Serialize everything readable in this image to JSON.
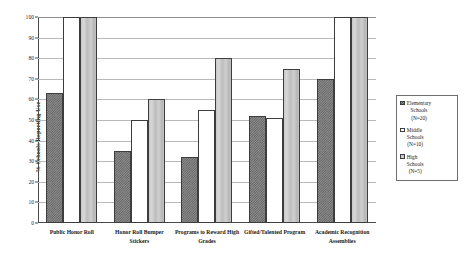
{
  "chart_data": {
    "type": "bar",
    "title": "",
    "xlabel": "",
    "ylabel": "% Schools Reporting Use",
    "ylim": [
      0,
      100
    ],
    "ytick_step": 10,
    "yticks": [
      0,
      10,
      20,
      30,
      40,
      50,
      60,
      70,
      80,
      90,
      100
    ],
    "grid": true,
    "legend_position": "right",
    "categories": [
      "Public Honor Roll",
      "Honor Roll Bumper Stickers",
      "Programs to Reward High Grades",
      "Gifted/Talented Program",
      "Academic Recognition Assemblies"
    ],
    "series": [
      {
        "name": "Elementary Schools (N=20)",
        "key": "elementary",
        "values": [
          63,
          35,
          32,
          52,
          70
        ]
      },
      {
        "name": "Middle Schools (N=10)",
        "key": "middle",
        "values": [
          100,
          50,
          55,
          51,
          100
        ]
      },
      {
        "name": "High Schools (N=5)",
        "key": "high",
        "values": [
          100,
          60,
          80,
          75,
          100
        ]
      }
    ]
  },
  "legend": {
    "entries": [
      {
        "line1": "Elementary",
        "line2": "Schools",
        "line3": "(N=20)"
      },
      {
        "line1": "Middle",
        "line2": "Schools",
        "line3": "(N=10)"
      },
      {
        "line1": "High",
        "line2": "Schools",
        "line3": "(N=5)"
      }
    ]
  },
  "xlabels": [
    {
      "line1": "Public Honor Roll",
      "line2": ""
    },
    {
      "line1": "Honor Roll Bumper",
      "line2": "Stickers"
    },
    {
      "line1": "Programs to Reward High",
      "line2": "Grades"
    },
    {
      "line1": "Gifted/Talented Program",
      "line2": ""
    },
    {
      "line1": "Academic Recognition",
      "line2": "Assemblies"
    }
  ],
  "colors": {
    "elementary": "#8d8d8d",
    "middle": "#ffffff",
    "high": "#c6c6c6",
    "grid": "#b9b9b9",
    "axis": "#4a4a4a"
  }
}
